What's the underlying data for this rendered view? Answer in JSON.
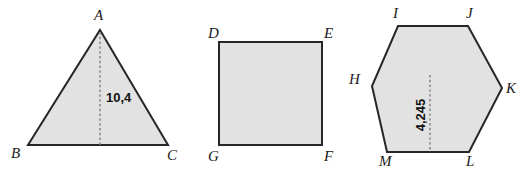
{
  "canvas": {
    "width": 531,
    "height": 170,
    "background": "#ffffff",
    "fill_color": "#e2e2e2",
    "stroke_color": "#262626",
    "dimension_line_color": "#8c8c8c"
  },
  "figures": {
    "triangle": {
      "name": "triangle",
      "shape_type": "triangle",
      "points": "100,30 168,145 28,145",
      "vertices": [
        {
          "label": "A",
          "x": 94,
          "y": 20
        },
        {
          "label": "B",
          "x": 11,
          "y": 158
        },
        {
          "label": "C",
          "x": 167,
          "y": 160
        }
      ],
      "dimension": {
        "label": "10,4",
        "line": {
          "x1": 100,
          "y1": 32,
          "x2": 100,
          "y2": 145
        },
        "text_x": 106,
        "text_y": 102
      }
    },
    "square": {
      "name": "square",
      "shape_type": "square",
      "points": "219,42 322,42 322,145 219,145",
      "vertices": [
        {
          "label": "D",
          "x": 208,
          "y": 38
        },
        {
          "label": "E",
          "x": 324,
          "y": 38
        },
        {
          "label": "G",
          "x": 208,
          "y": 161
        },
        {
          "label": "F",
          "x": 324,
          "y": 161
        }
      ]
    },
    "hexagon": {
      "name": "hexagon",
      "shape_type": "hexagon",
      "points": "398,26 468,26 502,88 469,152 387,152 372,86",
      "vertices": [
        {
          "label": "I",
          "x": 393,
          "y": 18
        },
        {
          "label": "J",
          "x": 466,
          "y": 18
        },
        {
          "label": "K",
          "x": 506,
          "y": 93
        },
        {
          "label": "L",
          "x": 466,
          "y": 166
        },
        {
          "label": "M",
          "x": 379,
          "y": 166
        },
        {
          "label": "H",
          "x": 349,
          "y": 84
        }
      ],
      "dimension": {
        "label": "4,245",
        "line": {
          "x1": 430,
          "y1": 75,
          "x2": 430,
          "y2": 152
        },
        "text_x": 425,
        "text_y": 115
      }
    }
  }
}
